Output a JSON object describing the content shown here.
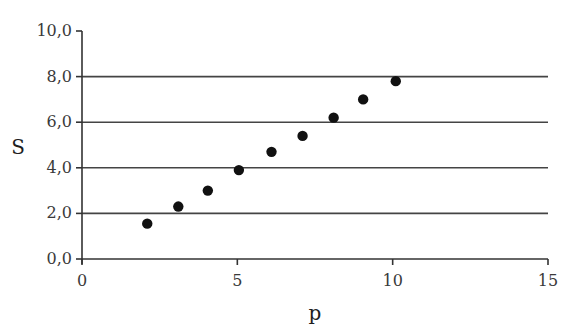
{
  "chart_data": {
    "type": "scatter",
    "title": "",
    "xlabel": "p",
    "ylabel": "S",
    "xlim": [
      0,
      15
    ],
    "ylim": [
      0,
      10
    ],
    "x_ticks": [
      0,
      5,
      10,
      15
    ],
    "x_tick_labels": [
      "0",
      "5",
      "10",
      "15"
    ],
    "y_ticks": [
      0,
      2,
      4,
      6,
      8,
      10
    ],
    "y_tick_labels": [
      "0,0",
      "2,0",
      "4,0",
      "6,0",
      "8,0",
      "10,0"
    ],
    "grid": {
      "horizontal": true,
      "vertical": false,
      "lines_at": [
        2,
        4,
        6,
        8
      ]
    },
    "legend": null,
    "series": [
      {
        "name": "S vs p",
        "marker": "filled-circle",
        "color": "#111111",
        "x": [
          2.1,
          3.1,
          4.05,
          5.05,
          6.1,
          7.1,
          8.1,
          9.05,
          10.1
        ],
        "y": [
          1.55,
          2.3,
          3.0,
          3.9,
          4.7,
          5.4,
          6.2,
          7.0,
          7.8
        ]
      }
    ]
  },
  "colors": {
    "axis": "#333333",
    "grid": "#444444",
    "marker": "#111111",
    "background": "#ffffff"
  }
}
